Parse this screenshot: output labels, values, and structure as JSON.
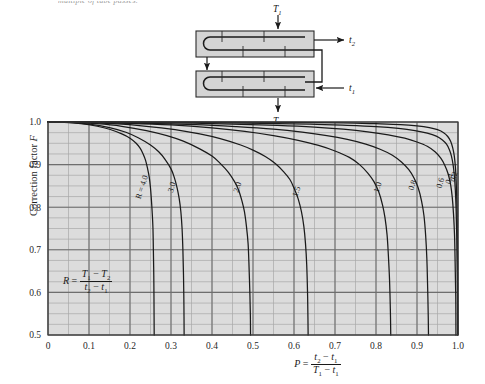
{
  "page": {
    "cut_caption": "multiple of tube passes."
  },
  "diagram": {
    "name": "two-shell-pass-heat-exchanger",
    "labels": {
      "shell_in": "T",
      "shell_in_sub": "1",
      "shell_out": "T",
      "shell_out_sub": "2",
      "tube_in": "t",
      "tube_in_sub": "1",
      "tube_out": "t",
      "tube_out_sub": "2"
    }
  },
  "chart_data": {
    "type": "line",
    "title": "",
    "xlabel": "P = (t2 - t1) / (T1 - t1)",
    "ylabel": "Correction factor F",
    "xlim": [
      0,
      1.0
    ],
    "ylim": [
      0.5,
      1.0
    ],
    "grid": true,
    "legend_position": "inline-curve-labels",
    "x_ticks": [
      "0",
      "0.1",
      "0.2",
      "0.3",
      "0.4",
      "0.5",
      "0.6",
      "0.7",
      "0.8",
      "0.9",
      "1.0"
    ],
    "y_ticks": [
      "0.5",
      "0.6",
      "0.7",
      "0.8",
      "0.9",
      "1.0"
    ],
    "x_minor_step": 0.05,
    "y_minor_step": 0.025,
    "annotation": "R = (T1 - T2) / (t2 - t1)",
    "series": [
      {
        "name": "R = 4.0",
        "label": "R = 4.0",
        "points": [
          [
            0.0,
            1.0
          ],
          [
            0.04,
            0.999
          ],
          [
            0.08,
            0.996
          ],
          [
            0.12,
            0.99
          ],
          [
            0.15,
            0.983
          ],
          [
            0.18,
            0.972
          ],
          [
            0.2,
            0.962
          ],
          [
            0.215,
            0.95
          ],
          [
            0.225,
            0.938
          ],
          [
            0.232,
            0.925
          ],
          [
            0.238,
            0.91
          ],
          [
            0.243,
            0.89
          ],
          [
            0.247,
            0.87
          ],
          [
            0.25,
            0.845
          ],
          [
            0.252,
            0.82
          ],
          [
            0.254,
            0.79
          ],
          [
            0.256,
            0.75
          ],
          [
            0.257,
            0.7
          ],
          [
            0.258,
            0.64
          ],
          [
            0.2585,
            0.58
          ],
          [
            0.259,
            0.5
          ]
        ]
      },
      {
        "name": "R = 3.0",
        "label": "3.0",
        "points": [
          [
            0.0,
            1.0
          ],
          [
            0.05,
            0.999
          ],
          [
            0.1,
            0.995
          ],
          [
            0.15,
            0.987
          ],
          [
            0.19,
            0.976
          ],
          [
            0.22,
            0.963
          ],
          [
            0.25,
            0.946
          ],
          [
            0.27,
            0.93
          ],
          [
            0.285,
            0.913
          ],
          [
            0.3,
            0.89
          ],
          [
            0.308,
            0.87
          ],
          [
            0.315,
            0.845
          ],
          [
            0.32,
            0.82
          ],
          [
            0.324,
            0.79
          ],
          [
            0.327,
            0.75
          ],
          [
            0.329,
            0.7
          ],
          [
            0.3305,
            0.64
          ],
          [
            0.3315,
            0.57
          ],
          [
            0.332,
            0.5
          ]
        ]
      },
      {
        "name": "R = 2.0",
        "label": "2.0",
        "points": [
          [
            0.0,
            1.0
          ],
          [
            0.06,
            0.999
          ],
          [
            0.12,
            0.996
          ],
          [
            0.18,
            0.99
          ],
          [
            0.24,
            0.98
          ],
          [
            0.29,
            0.968
          ],
          [
            0.33,
            0.955
          ],
          [
            0.37,
            0.937
          ],
          [
            0.4,
            0.92
          ],
          [
            0.42,
            0.903
          ],
          [
            0.44,
            0.882
          ],
          [
            0.455,
            0.86
          ],
          [
            0.465,
            0.84
          ],
          [
            0.473,
            0.815
          ],
          [
            0.479,
            0.79
          ],
          [
            0.484,
            0.755
          ],
          [
            0.488,
            0.715
          ],
          [
            0.49,
            0.67
          ],
          [
            0.492,
            0.61
          ],
          [
            0.4935,
            0.55
          ],
          [
            0.494,
            0.5
          ]
        ]
      },
      {
        "name": "R = 1.5",
        "label": "1.5",
        "points": [
          [
            0.0,
            1.0
          ],
          [
            0.08,
            0.999
          ],
          [
            0.16,
            0.996
          ],
          [
            0.24,
            0.99
          ],
          [
            0.31,
            0.982
          ],
          [
            0.37,
            0.972
          ],
          [
            0.42,
            0.961
          ],
          [
            0.47,
            0.946
          ],
          [
            0.5,
            0.934
          ],
          [
            0.53,
            0.919
          ],
          [
            0.555,
            0.902
          ],
          [
            0.575,
            0.883
          ],
          [
            0.59,
            0.865
          ],
          [
            0.6,
            0.845
          ],
          [
            0.61,
            0.82
          ],
          [
            0.618,
            0.79
          ],
          [
            0.624,
            0.755
          ],
          [
            0.628,
            0.715
          ],
          [
            0.631,
            0.665
          ],
          [
            0.633,
            0.6
          ],
          [
            0.634,
            0.54
          ],
          [
            0.6345,
            0.5
          ]
        ]
      },
      {
        "name": "R = 1.0",
        "label": "1.0",
        "points": [
          [
            0.0,
            1.0
          ],
          [
            0.1,
            0.999
          ],
          [
            0.2,
            0.997
          ],
          [
            0.3,
            0.993
          ],
          [
            0.4,
            0.986
          ],
          [
            0.48,
            0.978
          ],
          [
            0.55,
            0.968
          ],
          [
            0.61,
            0.957
          ],
          [
            0.66,
            0.945
          ],
          [
            0.7,
            0.932
          ],
          [
            0.735,
            0.917
          ],
          [
            0.76,
            0.9
          ],
          [
            0.78,
            0.88
          ],
          [
            0.795,
            0.86
          ],
          [
            0.807,
            0.835
          ],
          [
            0.816,
            0.805
          ],
          [
            0.822,
            0.775
          ],
          [
            0.827,
            0.735
          ],
          [
            0.83,
            0.69
          ],
          [
            0.833,
            0.63
          ],
          [
            0.835,
            0.56
          ],
          [
            0.836,
            0.5
          ]
        ]
      },
      {
        "name": "R = 0.8",
        "label": "0.8",
        "points": [
          [
            0.0,
            1.0
          ],
          [
            0.12,
            0.999
          ],
          [
            0.24,
            0.997
          ],
          [
            0.36,
            0.994
          ],
          [
            0.46,
            0.989
          ],
          [
            0.55,
            0.983
          ],
          [
            0.62,
            0.976
          ],
          [
            0.68,
            0.968
          ],
          [
            0.73,
            0.959
          ],
          [
            0.775,
            0.948
          ],
          [
            0.81,
            0.936
          ],
          [
            0.84,
            0.922
          ],
          [
            0.862,
            0.906
          ],
          [
            0.88,
            0.888
          ],
          [
            0.893,
            0.868
          ],
          [
            0.903,
            0.845
          ],
          [
            0.911,
            0.815
          ],
          [
            0.917,
            0.78
          ],
          [
            0.921,
            0.735
          ],
          [
            0.924,
            0.68
          ],
          [
            0.926,
            0.61
          ],
          [
            0.9275,
            0.54
          ],
          [
            0.928,
            0.5
          ]
        ]
      },
      {
        "name": "R = 0.6",
        "label": "0.6",
        "points": [
          [
            0.0,
            1.0
          ],
          [
            0.15,
            0.999
          ],
          [
            0.3,
            0.998
          ],
          [
            0.45,
            0.995
          ],
          [
            0.56,
            0.992
          ],
          [
            0.65,
            0.988
          ],
          [
            0.72,
            0.983
          ],
          [
            0.78,
            0.977
          ],
          [
            0.83,
            0.97
          ],
          [
            0.87,
            0.962
          ],
          [
            0.9,
            0.953
          ],
          [
            0.925,
            0.943
          ],
          [
            0.944,
            0.93
          ],
          [
            0.958,
            0.915
          ],
          [
            0.968,
            0.898
          ],
          [
            0.976,
            0.878
          ],
          [
            0.982,
            0.853
          ],
          [
            0.986,
            0.823
          ],
          [
            0.989,
            0.785
          ],
          [
            0.9915,
            0.735
          ],
          [
            0.993,
            0.67
          ],
          [
            0.9945,
            0.59
          ],
          [
            0.995,
            0.5
          ]
        ]
      },
      {
        "name": "R = 0.4",
        "label": "0.4",
        "points": [
          [
            0.0,
            1.0
          ],
          [
            0.18,
            1.0
          ],
          [
            0.36,
            0.999
          ],
          [
            0.52,
            0.997
          ],
          [
            0.64,
            0.995
          ],
          [
            0.73,
            0.992
          ],
          [
            0.8,
            0.989
          ],
          [
            0.855,
            0.985
          ],
          [
            0.895,
            0.98
          ],
          [
            0.925,
            0.974
          ],
          [
            0.947,
            0.967
          ],
          [
            0.962,
            0.958
          ],
          [
            0.972,
            0.948
          ],
          [
            0.979,
            0.935
          ],
          [
            0.984,
            0.92
          ],
          [
            0.988,
            0.9
          ],
          [
            0.991,
            0.875
          ],
          [
            0.9935,
            0.84
          ],
          [
            0.9955,
            0.79
          ],
          [
            0.997,
            0.73
          ],
          [
            0.998,
            0.65
          ],
          [
            0.9988,
            0.57
          ],
          [
            0.9992,
            0.5
          ]
        ]
      },
      {
        "name": "R = 0.2",
        "label": "0.2",
        "points": [
          [
            0.0,
            1.0
          ],
          [
            0.25,
            1.0
          ],
          [
            0.45,
            0.9995
          ],
          [
            0.6,
            0.999
          ],
          [
            0.72,
            0.998
          ],
          [
            0.8,
            0.996
          ],
          [
            0.86,
            0.994
          ],
          [
            0.9,
            0.991
          ],
          [
            0.93,
            0.987
          ],
          [
            0.95,
            0.982
          ],
          [
            0.965,
            0.975
          ],
          [
            0.975,
            0.966
          ],
          [
            0.982,
            0.955
          ],
          [
            0.987,
            0.94
          ],
          [
            0.991,
            0.92
          ],
          [
            0.994,
            0.89
          ],
          [
            0.996,
            0.85
          ],
          [
            0.9975,
            0.8
          ],
          [
            0.9985,
            0.73
          ],
          [
            0.9992,
            0.65
          ],
          [
            0.9996,
            0.57
          ],
          [
            0.9999,
            0.5
          ]
        ]
      }
    ],
    "curve_label_positions": [
      {
        "label": "R = 4.0",
        "x": 0.235,
        "y": 0.845
      },
      {
        "label": "3.0",
        "x": 0.308,
        "y": 0.845
      },
      {
        "label": "2.0",
        "x": 0.468,
        "y": 0.845
      },
      {
        "label": "1.5",
        "x": 0.612,
        "y": 0.835
      },
      {
        "label": "1.0",
        "x": 0.81,
        "y": 0.845
      },
      {
        "label": "0.8",
        "x": 0.895,
        "y": 0.85
      },
      {
        "label": "0.6",
        "x": 0.963,
        "y": 0.855
      },
      {
        "label": "0.4",
        "x": 0.985,
        "y": 0.865
      },
      {
        "label": "0.2",
        "x": 0.9955,
        "y": 0.87
      }
    ]
  },
  "colors": {
    "plot_fill": "#dcdcdc",
    "grid_major": "#6e6e6e",
    "grid_minor": "#a8a8a8",
    "curve": "#1a1a1a",
    "axis": "#3a3a3a",
    "diagram_fill": "#d4d4d4",
    "page_bg": "#ffffff"
  }
}
